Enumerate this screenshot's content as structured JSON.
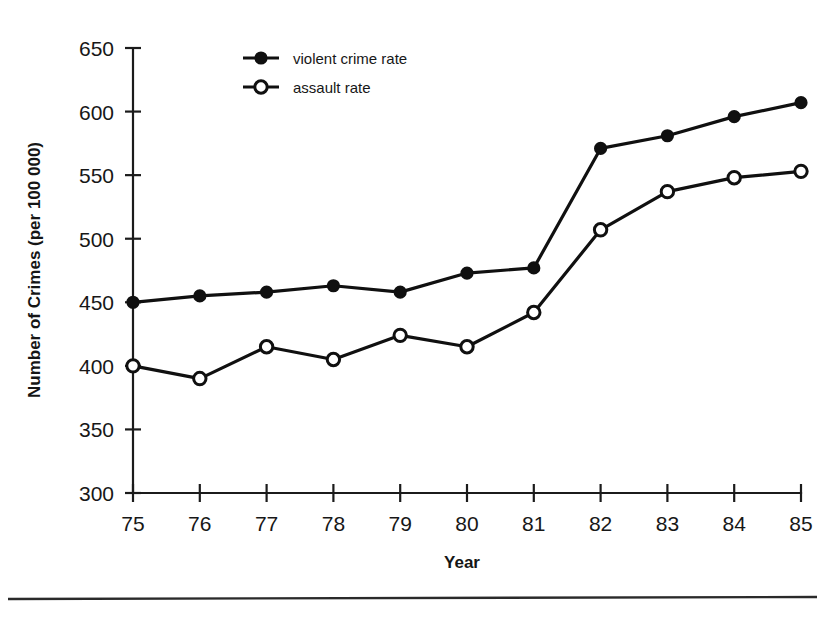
{
  "figure": {
    "background_color": "#ffffff",
    "ink_color": "#101010",
    "title_clipped": "",
    "footer_rule": true
  },
  "chart_data": {
    "type": "line",
    "title": "",
    "xlabel": "Year",
    "ylabel": "Number of Crimes (per 100 000)",
    "x": [
      75,
      76,
      77,
      78,
      79,
      80,
      81,
      82,
      83,
      84,
      85
    ],
    "xtick_labels": [
      "75",
      "76",
      "77",
      "78",
      "79",
      "80",
      "81",
      "82",
      "83",
      "84",
      "85"
    ],
    "ytick_labels": [
      "300",
      "350",
      "400",
      "450",
      "500",
      "550",
      "600",
      "650"
    ],
    "yticks": [
      300,
      350,
      400,
      450,
      500,
      550,
      600,
      650
    ],
    "ylim": [
      300,
      650
    ],
    "xlim": [
      75,
      85
    ],
    "grid": false,
    "legend_position": "top-left-inside",
    "series": [
      {
        "name": "violent crime rate",
        "marker": "filled-circle",
        "values": [
          450,
          455,
          458,
          463,
          458,
          473,
          477,
          571,
          581,
          596,
          607
        ]
      },
      {
        "name": "assault rate",
        "marker": "open-circle",
        "values": [
          400,
          390,
          415,
          405,
          424,
          415,
          442,
          507,
          537,
          548,
          553
        ]
      }
    ]
  },
  "legend": {
    "items": [
      {
        "label": "violent crime rate",
        "marker": "filled-circle"
      },
      {
        "label": "assault rate",
        "marker": "open-circle"
      }
    ]
  },
  "axes": {
    "x_title": "Year",
    "y_title": "Number of Crimes (per 100 000)"
  }
}
